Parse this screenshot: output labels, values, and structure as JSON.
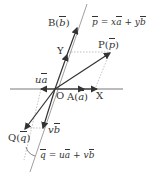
{
  "diagram": {
    "type": "vector-decomposition",
    "points": {
      "O": {
        "label": "O"
      },
      "A": {
        "label": "A",
        "vector": "a"
      },
      "B": {
        "label": "B",
        "vector": "b"
      },
      "P": {
        "label": "P",
        "vector": "p"
      },
      "Q": {
        "label": "Q",
        "vector": "q"
      }
    },
    "axes": {
      "x_label": "X",
      "y_label": "Y"
    },
    "equations": {
      "p": {
        "lhs": "p",
        "eq": "=",
        "t1c": "x",
        "t1v": "a",
        "plus": "+",
        "t2c": "y",
        "t2v": "b"
      },
      "q": {
        "lhs": "q",
        "eq": "=",
        "t1c": "u",
        "t1v": "a",
        "plus": "+",
        "t2c": "v",
        "t2v": "b"
      }
    },
    "components": {
      "ua": {
        "c": "u",
        "v": "a"
      },
      "vb": {
        "c": "v",
        "v": "b"
      }
    },
    "colors": {
      "line": "#333333",
      "guide": "#999999"
    }
  }
}
